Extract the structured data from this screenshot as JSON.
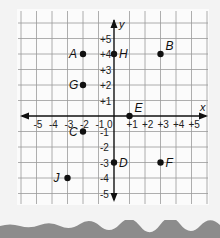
{
  "chart_data": {
    "type": "scatter",
    "title": "",
    "xlabel": "x",
    "ylabel": "y",
    "xlim": [
      -5,
      5
    ],
    "ylim": [
      -5,
      5
    ],
    "grid": true,
    "x_ticks": [
      "-5",
      "-4",
      "-3",
      "-2",
      "-1",
      "0",
      "+1",
      "+2",
      "+3",
      "+4",
      "+5"
    ],
    "y_ticks": [
      "+5",
      "+4",
      "+3",
      "+2",
      "+1",
      "-1",
      "-2",
      "-3",
      "-4",
      "-5"
    ],
    "points": [
      {
        "label": "A",
        "x": -2,
        "y": 4,
        "label_side": "left"
      },
      {
        "label": "B",
        "x": 3,
        "y": 4,
        "label_side": "upper-right"
      },
      {
        "label": "C",
        "x": -2,
        "y": -1,
        "label_side": "left"
      },
      {
        "label": "D",
        "x": 0,
        "y": -3,
        "label_side": "right"
      },
      {
        "label": "E",
        "x": 1,
        "y": 0,
        "label_side": "upper-right"
      },
      {
        "label": "F",
        "x": 3,
        "y": -3,
        "label_side": "right"
      },
      {
        "label": "G",
        "x": -2,
        "y": 2,
        "label_side": "left"
      },
      {
        "label": "H",
        "x": 0,
        "y": 4,
        "label_side": "right"
      },
      {
        "label": "J",
        "x": -3,
        "y": -4,
        "label_side": "left"
      }
    ]
  },
  "colors": {
    "background": "#f3f3f3",
    "panel": "#fbfbfb",
    "grid": "#9a9a9a",
    "axis": "#111111",
    "point": "#111111",
    "torn_edge": "#8c8c8c"
  }
}
